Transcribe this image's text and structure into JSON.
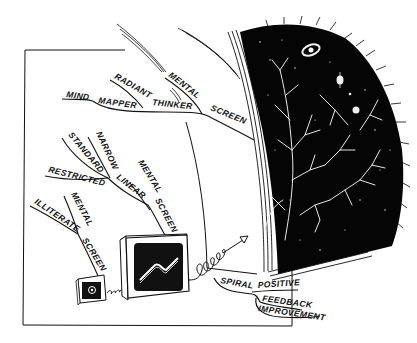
{
  "illustration": {
    "colors": {
      "ink": "#111111",
      "paper": "#ffffff",
      "space": "#050505",
      "glow": "#f2f2f2"
    },
    "top_branch": {
      "words": [
        "MIND",
        "MAPPER",
        "RADIANT",
        "THINKER",
        "MENTAL",
        "SCREEN"
      ]
    },
    "middle_branch": {
      "words": [
        "STANDARD",
        "NARROW",
        "RESTRICTED",
        "LINEAR",
        "MENTAL",
        "SCREEN"
      ]
    },
    "lower_branch": {
      "words": [
        "ILLITERATE",
        "MENTAL",
        "SCREEN"
      ]
    },
    "spiral_branch": {
      "words": [
        "SPIRAL",
        "POSITIVE",
        "FEEDBACK",
        "IMPROVEMENT"
      ]
    },
    "elements": {
      "small_screen": "small-screen-with-dot",
      "medium_screen": "screen-with-wave",
      "large_screen": "cosmic-screen-with-neuron-trees-galaxy-planets"
    }
  }
}
